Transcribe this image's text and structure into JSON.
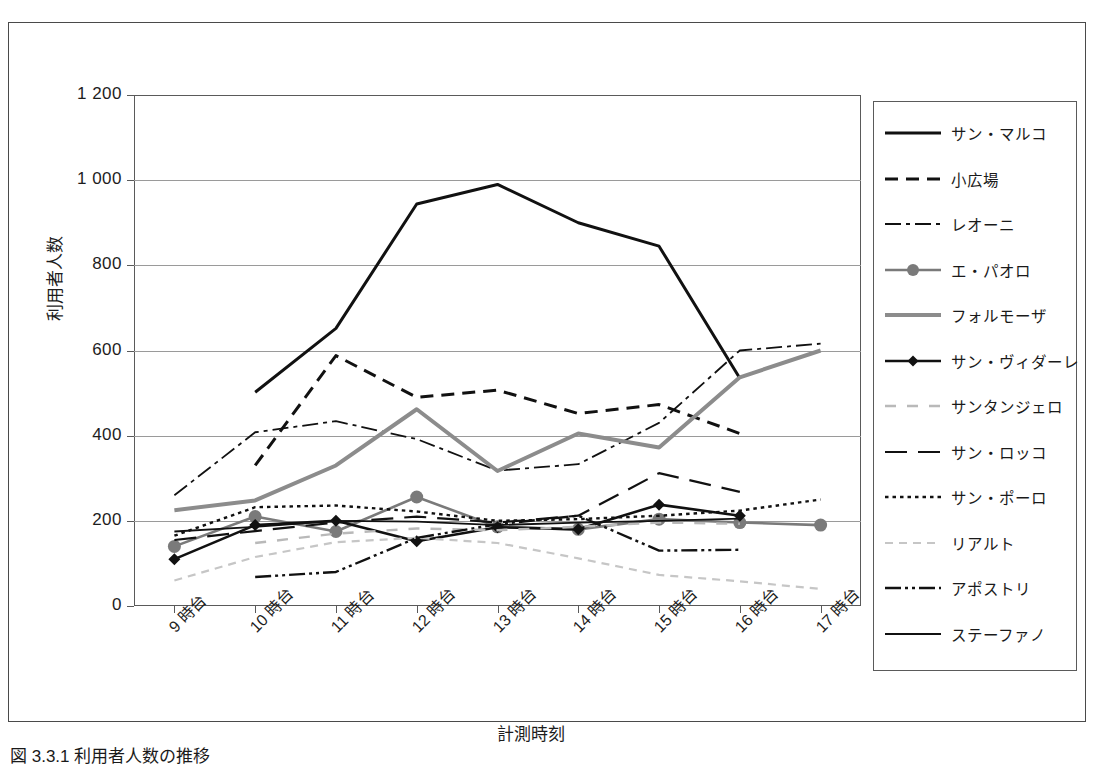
{
  "figure": {
    "caption": "図 3.3.1  利用者人数の推移"
  },
  "chart_data": {
    "type": "line",
    "title": "",
    "xlabel": "計測時刻",
    "ylabel": "利用者人数",
    "categories": [
      "9 時台",
      "10 時台",
      "11 時台",
      "12 時台",
      "13 時台",
      "14 時台",
      "15 時台",
      "16 時台",
      "17 時台"
    ],
    "ylim": [
      0,
      1200
    ],
    "ytick_labels": [
      "0",
      "200",
      "400",
      "600",
      "800",
      "1 000",
      "1 200"
    ],
    "ytick_values": [
      0,
      200,
      400,
      600,
      800,
      1000,
      1200
    ],
    "grid": "horizontal",
    "legend_position": "right",
    "series": [
      {
        "name": "サン・マルコ",
        "style": "solid",
        "color": "#111111",
        "width": 3,
        "marker": "none",
        "values": [
          null,
          502,
          652,
          944,
          990,
          900,
          845,
          535,
          null
        ]
      },
      {
        "name": "小広場",
        "style": "dashed",
        "color": "#111111",
        "width": 3,
        "marker": "none",
        "values": [
          null,
          330,
          588,
          490,
          507,
          452,
          473,
          405,
          null
        ]
      },
      {
        "name": "レオーニ",
        "style": "dashdot",
        "color": "#111111",
        "width": 1.8,
        "marker": "none",
        "values": [
          260,
          408,
          434,
          392,
          318,
          333,
          430,
          600,
          616
        ]
      },
      {
        "name": "エ・パオロ",
        "style": "solid",
        "color": "#7a7a7a",
        "width": 2.6,
        "marker": "circle",
        "values": [
          140,
          210,
          175,
          256,
          186,
          180,
          204,
          196,
          190
        ]
      },
      {
        "name": "フォルモーザ",
        "style": "solid",
        "color": "#8c8c8c",
        "width": 4,
        "marker": "none",
        "values": [
          225,
          248,
          330,
          462,
          317,
          405,
          372,
          537,
          600
        ]
      },
      {
        "name": "サン・ヴィダーレ",
        "style": "solid",
        "color": "#111111",
        "width": 2.6,
        "marker": "diamond",
        "values": [
          110,
          190,
          200,
          152,
          185,
          180,
          238,
          212,
          null
        ]
      },
      {
        "name": "サンタンジェロ",
        "style": "dashed-loose",
        "color": "#b9b9b9",
        "width": 2.4,
        "marker": "none",
        "values": [
          null,
          148,
          170,
          182,
          178,
          186,
          196,
          193,
          null
        ]
      },
      {
        "name": "サン・ロッコ",
        "style": "longdash",
        "color": "#111111",
        "width": 2.2,
        "marker": "none",
        "values": [
          155,
          176,
          196,
          210,
          196,
          212,
          312,
          268,
          null
        ]
      },
      {
        "name": "サン・ポーロ",
        "style": "dotted",
        "color": "#111111",
        "width": 2.4,
        "marker": "none",
        "values": [
          165,
          232,
          236,
          222,
          200,
          204,
          212,
          224,
          250
        ]
      },
      {
        "name": "リアルト",
        "style": "dashed-fine",
        "color": "#c6c6c6",
        "width": 2.2,
        "marker": "none",
        "values": [
          60,
          115,
          150,
          160,
          148,
          112,
          73,
          58,
          40
        ]
      },
      {
        "name": "アポストリ",
        "style": "dashdotdot",
        "color": "#111111",
        "width": 2.4,
        "marker": "none",
        "values": [
          null,
          68,
          80,
          160,
          192,
          212,
          130,
          132,
          null
        ]
      },
      {
        "name": "ステーファノ",
        "style": "solid",
        "color": "#111111",
        "width": 1.8,
        "marker": "none",
        "values": [
          175,
          186,
          200,
          198,
          190,
          196,
          200,
          205,
          null
        ]
      }
    ]
  }
}
